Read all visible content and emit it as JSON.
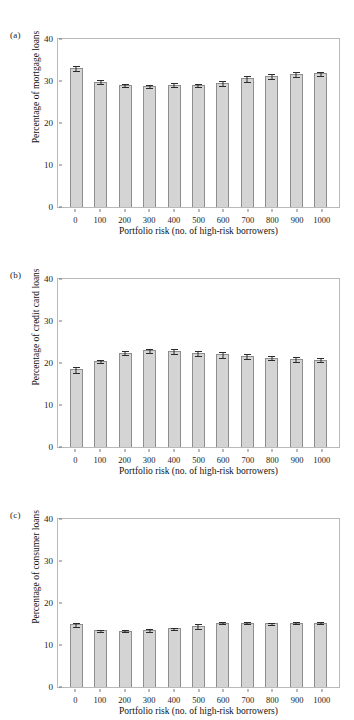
{
  "figure": {
    "panels": [
      {
        "tag": "(a)",
        "ylabel": "Percentage of mortgage loans",
        "xlabel": "Portfolio risk (no. of high-risk borrowers)"
      },
      {
        "tag": "(b)",
        "ylabel": "Percentage of credit card loans",
        "xlabel": "Portfolio risk (no. of high-risk borrowers)"
      },
      {
        "tag": "(c)",
        "ylabel": "Percentage of consumer loans",
        "xlabel": "Portfolio risk (no. of high-risk borrowers)"
      }
    ],
    "colors": {
      "bar_fill": "#d4d4d4",
      "bar_stroke": "#8e8e8e",
      "error_bar": "#2b2b2b",
      "frame": "#b9b9b9",
      "text": "#1a1a1a"
    }
  },
  "chart_data": [
    {
      "type": "bar",
      "panel": "(a)",
      "title": "",
      "xlabel": "Portfolio risk (no. of high-risk borrowers)",
      "ylabel": "Percentage of mortgage loans",
      "categories": [
        "0",
        "100",
        "200",
        "300",
        "400",
        "500",
        "600",
        "700",
        "800",
        "900",
        "1000"
      ],
      "values": [
        33.0,
        29.8,
        29.0,
        28.9,
        29.1,
        29.1,
        29.6,
        30.6,
        31.2,
        31.6,
        31.8
      ],
      "errors": [
        0.7,
        0.6,
        0.5,
        0.5,
        0.6,
        0.5,
        0.7,
        0.9,
        0.7,
        0.7,
        0.6
      ],
      "ylim": [
        0,
        40
      ],
      "yticks": [
        0,
        10,
        20,
        30,
        40
      ],
      "grid": false,
      "legend": "none"
    },
    {
      "type": "bar",
      "panel": "(b)",
      "title": "",
      "xlabel": "Portfolio risk (no. of high-risk borrowers)",
      "ylabel": "Percentage of credit card loans",
      "categories": [
        "0",
        "100",
        "200",
        "300",
        "400",
        "500",
        "600",
        "700",
        "800",
        "900",
        "1000"
      ],
      "values": [
        18.5,
        20.4,
        22.4,
        23.0,
        22.9,
        22.4,
        22.1,
        21.7,
        21.3,
        21.0,
        20.8
      ],
      "errors": [
        0.9,
        0.5,
        0.6,
        0.5,
        0.7,
        0.7,
        0.8,
        0.8,
        0.6,
        0.7,
        0.6
      ],
      "ylim": [
        0,
        40
      ],
      "yticks": [
        0,
        10,
        20,
        30,
        40
      ],
      "grid": false,
      "legend": "none"
    },
    {
      "type": "bar",
      "panel": "(c)",
      "title": "",
      "xlabel": "Portfolio risk (no. of high-risk borrowers)",
      "ylabel": "Percentage of consumer loans",
      "categories": [
        "0",
        "100",
        "200",
        "300",
        "400",
        "500",
        "600",
        "700",
        "800",
        "900",
        "1000"
      ],
      "values": [
        14.9,
        13.5,
        13.4,
        13.6,
        14.0,
        14.6,
        15.3,
        15.3,
        15.2,
        15.3,
        15.3
      ],
      "errors": [
        0.6,
        0.4,
        0.3,
        0.4,
        0.4,
        0.7,
        0.4,
        0.4,
        0.4,
        0.4,
        0.4
      ],
      "ylim": [
        0,
        40
      ],
      "yticks": [
        0,
        10,
        20,
        30,
        40
      ],
      "grid": false,
      "legend": "none"
    }
  ]
}
